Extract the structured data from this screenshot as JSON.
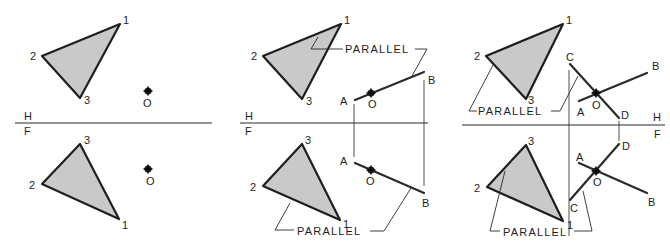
{
  "figure": {
    "colors": {
      "triangle_fill": "#c9c9c9",
      "line": "#1e1e1e",
      "background": "#ffffff"
    },
    "plane_labels": {
      "top": "H",
      "bottom": "F"
    },
    "point_label": "O",
    "note_label": "PARALLEL",
    "panels": [
      {
        "name": "given",
        "top_view": {
          "vertex_labels": [
            "1",
            "2",
            "3"
          ],
          "point": "O"
        },
        "front_view": {
          "vertex_labels": [
            "3",
            "2",
            "1"
          ],
          "point": "O"
        }
      },
      {
        "name": "step-1-line-ab",
        "top_view": {
          "vertex_labels": [
            "1",
            "2",
            "3"
          ],
          "line_labels": [
            "A",
            "B"
          ],
          "point": "O",
          "note": "PARALLEL"
        },
        "front_view": {
          "vertex_labels": [
            "3",
            "2",
            "1"
          ],
          "line_labels": [
            "A",
            "B"
          ],
          "point": "O",
          "note": "PARALLEL"
        }
      },
      {
        "name": "step-2-line-cd",
        "top_view": {
          "vertex_labels": [
            "1",
            "2",
            "3"
          ],
          "line_labels": [
            "C",
            "D",
            "A",
            "B"
          ],
          "point": "O",
          "note": "PARALLEL"
        },
        "front_view": {
          "vertex_labels": [
            "3",
            "2",
            "1"
          ],
          "line_labels": [
            "D",
            "A",
            "C",
            "B"
          ],
          "point": "O",
          "note": "PARALLEL"
        }
      }
    ]
  }
}
